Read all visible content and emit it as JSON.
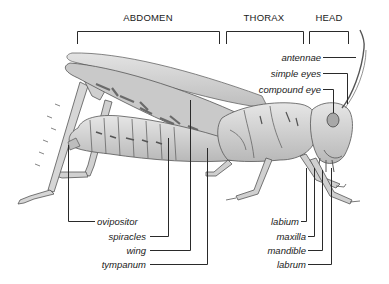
{
  "diagram": {
    "regions": [
      {
        "label": "ABDOMEN"
      },
      {
        "label": "THORAX"
      },
      {
        "label": "HEAD"
      }
    ],
    "labels_left": [
      {
        "label": "ovipositor"
      },
      {
        "label": "spiracles"
      },
      {
        "label": "wing"
      },
      {
        "label": "tympanum"
      }
    ],
    "labels_right_top": [
      {
        "label": "antennae"
      },
      {
        "label": "simple eyes"
      },
      {
        "label": "compound eye"
      }
    ],
    "labels_right_bottom": [
      {
        "label": "labium"
      },
      {
        "label": "maxilla"
      },
      {
        "label": "mandible"
      },
      {
        "label": "labrum"
      }
    ],
    "colors": {
      "line": "#2a2a2a",
      "body_fill": "#d9d9d9",
      "body_stroke": "#555555",
      "wing_fill": "#cfcfcf",
      "pattern": "#6a6a6a"
    }
  }
}
